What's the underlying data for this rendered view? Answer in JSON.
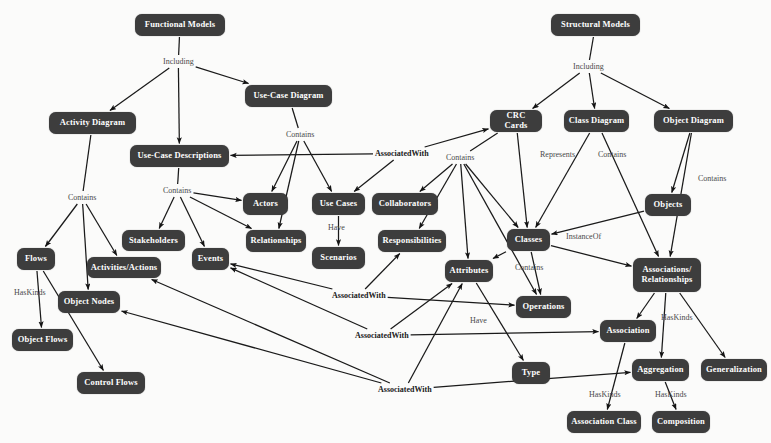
{
  "diagram": {
    "node_fill": "#3d3d3d",
    "node_text": "#ffffff",
    "edge_color": "#1a1a1a",
    "label_color": "#4a4a4a",
    "background": "#fbfbfa",
    "nodes": [
      {
        "id": "functional_models",
        "label": "Functional Models",
        "x": 135,
        "y": 14,
        "w": 90,
        "h": 22
      },
      {
        "id": "structural_models",
        "label": "Structural Models",
        "x": 551,
        "y": 14,
        "w": 89,
        "h": 22
      },
      {
        "id": "use_case_diagram",
        "label": "Use-Case Diagram",
        "x": 245,
        "y": 85,
        "w": 87,
        "h": 22
      },
      {
        "id": "activity_diagram",
        "label": "Activity Diagram",
        "x": 49,
        "y": 112,
        "w": 87,
        "h": 22
      },
      {
        "id": "crc_cards",
        "label": "CRC Cards",
        "x": 490,
        "y": 110,
        "w": 52,
        "h": 22
      },
      {
        "id": "class_diagram",
        "label": "Class Diagram",
        "x": 564,
        "y": 110,
        "w": 65,
        "h": 22
      },
      {
        "id": "object_diagram",
        "label": "Object Diagram",
        "x": 654,
        "y": 110,
        "w": 79,
        "h": 22
      },
      {
        "id": "use_case_descriptions",
        "label": "Use-Case Descriptions",
        "x": 130,
        "y": 145,
        "w": 99,
        "h": 22
      },
      {
        "id": "actors",
        "label": "Actors",
        "x": 243,
        "y": 193,
        "w": 45,
        "h": 22
      },
      {
        "id": "use_cases",
        "label": "Use Cases",
        "x": 312,
        "y": 193,
        "w": 53,
        "h": 22
      },
      {
        "id": "collaborators",
        "label": "Collaborators",
        "x": 372,
        "y": 193,
        "w": 66,
        "h": 22
      },
      {
        "id": "objects",
        "label": "Objects",
        "x": 645,
        "y": 194,
        "w": 46,
        "h": 22
      },
      {
        "id": "stakeholders",
        "label": "Stakeholders",
        "x": 122,
        "y": 230,
        "w": 63,
        "h": 21
      },
      {
        "id": "relationships",
        "label": "Relationships",
        "x": 246,
        "y": 230,
        "w": 60,
        "h": 22
      },
      {
        "id": "responsibilities",
        "label": "Responsibilities",
        "x": 378,
        "y": 230,
        "w": 68,
        "h": 22
      },
      {
        "id": "classes",
        "label": "Classes",
        "x": 507,
        "y": 229,
        "w": 43,
        "h": 22
      },
      {
        "id": "events",
        "label": "Events",
        "x": 192,
        "y": 248,
        "w": 37,
        "h": 22
      },
      {
        "id": "flows",
        "label": "Flows",
        "x": 17,
        "y": 248,
        "w": 38,
        "h": 22
      },
      {
        "id": "scenarios",
        "label": "Scenarios",
        "x": 312,
        "y": 247,
        "w": 53,
        "h": 22
      },
      {
        "id": "activities_actions",
        "label": "Activities/Actions",
        "x": 87,
        "y": 257,
        "w": 74,
        "h": 21
      },
      {
        "id": "attributes",
        "label": "Attributes",
        "x": 445,
        "y": 260,
        "w": 48,
        "h": 22
      },
      {
        "id": "associations_relationships",
        "label": "Associations/\nRelationships",
        "x": 633,
        "y": 258,
        "w": 68,
        "h": 34
      },
      {
        "id": "object_nodes",
        "label": "Object Nodes",
        "x": 58,
        "y": 291,
        "w": 62,
        "h": 22
      },
      {
        "id": "operations",
        "label": "Operations",
        "x": 516,
        "y": 296,
        "w": 55,
        "h": 22
      },
      {
        "id": "association",
        "label": "Association",
        "x": 600,
        "y": 320,
        "w": 56,
        "h": 22
      },
      {
        "id": "object_flows",
        "label": "Object Flows",
        "x": 12,
        "y": 329,
        "w": 61,
        "h": 22
      },
      {
        "id": "type",
        "label": "Type",
        "x": 512,
        "y": 362,
        "w": 38,
        "h": 22
      },
      {
        "id": "aggregation",
        "label": "Aggregation",
        "x": 632,
        "y": 359,
        "w": 57,
        "h": 22
      },
      {
        "id": "generalization",
        "label": "Generalization",
        "x": 701,
        "y": 359,
        "w": 66,
        "h": 22
      },
      {
        "id": "control_flows",
        "label": "Control Flows",
        "x": 77,
        "y": 372,
        "w": 68,
        "h": 22
      },
      {
        "id": "association_class",
        "label": "Association Class",
        "x": 567,
        "y": 411,
        "w": 74,
        "h": 22
      },
      {
        "id": "composition",
        "label": "Composition",
        "x": 652,
        "y": 411,
        "w": 58,
        "h": 22
      }
    ],
    "edge_labels": [
      {
        "id": "lbl_including_left",
        "text": "Including",
        "x": 163,
        "y": 57,
        "bold": false
      },
      {
        "id": "lbl_including_right",
        "text": "Including",
        "x": 573,
        "y": 62,
        "bold": false
      },
      {
        "id": "lbl_contains_ucd",
        "text": "Contains",
        "x": 286,
        "y": 130,
        "bold": false
      },
      {
        "id": "lbl_assoc_1",
        "text": "AssociatedWith",
        "x": 375,
        "y": 149,
        "bold": true
      },
      {
        "id": "lbl_contains_crc",
        "text": "Contains",
        "x": 446,
        "y": 153,
        "bold": false
      },
      {
        "id": "lbl_represents",
        "text": "Represents",
        "x": 540,
        "y": 150,
        "bold": false
      },
      {
        "id": "lbl_contains_class",
        "text": "Contains",
        "x": 598,
        "y": 150,
        "bold": false
      },
      {
        "id": "lbl_contains_objdia",
        "text": "Contains",
        "x": 698,
        "y": 174,
        "bold": false
      },
      {
        "id": "lbl_contains_ucdesc",
        "text": "Contains",
        "x": 163,
        "y": 186,
        "bold": false
      },
      {
        "id": "lbl_contains_activity",
        "text": "Contains",
        "x": 68,
        "y": 193,
        "bold": false
      },
      {
        "id": "lbl_have_usecases",
        "text": "Have",
        "x": 328,
        "y": 223,
        "bold": false
      },
      {
        "id": "lbl_instanceof",
        "text": "InstanceOf",
        "x": 566,
        "y": 232,
        "bold": false
      },
      {
        "id": "lbl_contains_classes",
        "text": "Contains",
        "x": 515,
        "y": 263,
        "bold": false
      },
      {
        "id": "lbl_haskinds_flows",
        "text": "HasKinds",
        "x": 14,
        "y": 288,
        "bold": false
      },
      {
        "id": "lbl_assoc_2",
        "text": "AssociatedWith",
        "x": 332,
        "y": 291,
        "bold": true
      },
      {
        "id": "lbl_have_attributes",
        "text": "Have",
        "x": 470,
        "y": 316,
        "bold": false
      },
      {
        "id": "lbl_assoc_3",
        "text": "AssociatedWith",
        "x": 355,
        "y": 331,
        "bold": true
      },
      {
        "id": "lbl_haskinds_assoc",
        "text": "HasKinds",
        "x": 661,
        "y": 313,
        "bold": false
      },
      {
        "id": "lbl_haskinds_assocls",
        "text": "HasKinds",
        "x": 589,
        "y": 390,
        "bold": false
      },
      {
        "id": "lbl_haskinds_comp",
        "text": "HasKinds",
        "x": 655,
        "y": 390,
        "bold": false
      },
      {
        "id": "lbl_assoc_4",
        "text": "AssociatedWith",
        "x": 378,
        "y": 385,
        "bold": true
      }
    ],
    "edges": [
      {
        "from": "functional_models",
        "to": "lbl_including_left",
        "label": "Including"
      },
      {
        "from": "lbl_including_left",
        "to": "activity_diagram",
        "label": ""
      },
      {
        "from": "lbl_including_left",
        "to": "use_case_diagram",
        "label": ""
      },
      {
        "from": "lbl_including_left",
        "to": "use_case_descriptions",
        "label": ""
      },
      {
        "from": "structural_models",
        "to": "lbl_including_right",
        "label": "Including"
      },
      {
        "from": "lbl_including_right",
        "to": "crc_cards",
        "label": ""
      },
      {
        "from": "lbl_including_right",
        "to": "class_diagram",
        "label": ""
      },
      {
        "from": "lbl_including_right",
        "to": "object_diagram",
        "label": ""
      },
      {
        "from": "use_case_diagram",
        "to": "lbl_contains_ucd",
        "label": "Contains"
      },
      {
        "from": "lbl_contains_ucd",
        "to": "actors",
        "label": ""
      },
      {
        "from": "lbl_contains_ucd",
        "to": "use_cases",
        "label": ""
      },
      {
        "from": "lbl_contains_ucd",
        "to": "relationships",
        "label": ""
      },
      {
        "from": "use_case_descriptions",
        "to": "lbl_contains_ucdesc",
        "label": "Contains"
      },
      {
        "from": "lbl_contains_ucdesc",
        "to": "stakeholders",
        "label": ""
      },
      {
        "from": "lbl_contains_ucdesc",
        "to": "events",
        "label": ""
      },
      {
        "from": "lbl_contains_ucdesc",
        "to": "actors",
        "label": ""
      },
      {
        "from": "lbl_contains_ucdesc",
        "to": "relationships",
        "label": ""
      },
      {
        "from": "activity_diagram",
        "to": "lbl_contains_activity",
        "label": "Contains"
      },
      {
        "from": "lbl_contains_activity",
        "to": "flows",
        "label": ""
      },
      {
        "from": "lbl_contains_activity",
        "to": "activities_actions",
        "label": ""
      },
      {
        "from": "lbl_contains_activity",
        "to": "object_nodes",
        "label": ""
      },
      {
        "from": "flows",
        "to": "object_flows",
        "label": "HasKinds"
      },
      {
        "from": "flows",
        "to": "control_flows",
        "label": "HasKinds"
      },
      {
        "from": "use_cases",
        "to": "scenarios",
        "label": "Have"
      },
      {
        "from": "crc_cards",
        "to": "lbl_contains_crc",
        "label": "Contains"
      },
      {
        "from": "lbl_contains_crc",
        "to": "responsibilities",
        "label": ""
      },
      {
        "from": "lbl_contains_crc",
        "to": "collaborators",
        "label": ""
      },
      {
        "from": "lbl_contains_crc",
        "to": "attributes",
        "label": ""
      },
      {
        "from": "lbl_contains_crc",
        "to": "operations",
        "label": ""
      },
      {
        "from": "lbl_contains_crc",
        "to": "classes",
        "label": ""
      },
      {
        "from": "crc_cards",
        "to": "classes",
        "label": "Represents"
      },
      {
        "from": "class_diagram",
        "to": "classes",
        "label": "Contains"
      },
      {
        "from": "class_diagram",
        "to": "associations_relationships",
        "label": "Contains"
      },
      {
        "from": "object_diagram",
        "to": "objects",
        "label": "Contains"
      },
      {
        "from": "object_diagram",
        "to": "associations_relationships",
        "label": "Contains"
      },
      {
        "from": "objects",
        "to": "classes",
        "label": "InstanceOf"
      },
      {
        "from": "classes",
        "to": "attributes",
        "label": "Contains"
      },
      {
        "from": "classes",
        "to": "operations",
        "label": "Contains"
      },
      {
        "from": "classes",
        "to": "associations_relationships",
        "label": "Contains"
      },
      {
        "from": "attributes",
        "to": "type",
        "label": "Have"
      },
      {
        "from": "associations_relationships",
        "to": "association",
        "label": "HasKinds"
      },
      {
        "from": "associations_relationships",
        "to": "aggregation",
        "label": "HasKinds"
      },
      {
        "from": "associations_relationships",
        "to": "generalization",
        "label": "HasKinds"
      },
      {
        "from": "association",
        "to": "association_class",
        "label": "HasKinds"
      },
      {
        "from": "aggregation",
        "to": "composition",
        "label": "HasKinds"
      },
      {
        "from": "lbl_assoc_1",
        "to": "use_case_descriptions",
        "label": "AssociatedWith"
      },
      {
        "from": "lbl_assoc_1",
        "to": "use_cases",
        "label": "AssociatedWith"
      },
      {
        "from": "lbl_assoc_1",
        "to": "crc_cards",
        "label": "AssociatedWith"
      },
      {
        "from": "lbl_assoc_2",
        "to": "events",
        "label": "AssociatedWith"
      },
      {
        "from": "lbl_assoc_2",
        "to": "responsibilities",
        "label": "AssociatedWith"
      },
      {
        "from": "lbl_assoc_2",
        "to": "operations",
        "label": "AssociatedWith"
      },
      {
        "from": "lbl_assoc_3",
        "to": "events",
        "label": "AssociatedWith"
      },
      {
        "from": "lbl_assoc_3",
        "to": "attributes",
        "label": "AssociatedWith"
      },
      {
        "from": "lbl_assoc_3",
        "to": "association",
        "label": "AssociatedWith"
      },
      {
        "from": "lbl_assoc_4",
        "to": "activities_actions",
        "label": "AssociatedWith"
      },
      {
        "from": "lbl_assoc_4",
        "to": "object_nodes",
        "label": "AssociatedWith"
      },
      {
        "from": "lbl_assoc_4",
        "to": "attributes",
        "label": "AssociatedWith"
      },
      {
        "from": "lbl_assoc_4",
        "to": "aggregation",
        "label": "AssociatedWith"
      }
    ]
  }
}
